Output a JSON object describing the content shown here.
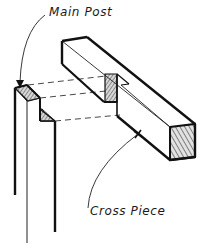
{
  "diagram": {
    "labels": {
      "main_post": "Main Post",
      "cross_piece": "Cross Piece"
    },
    "parts": [
      {
        "id": "main-post",
        "name": "Main Post",
        "description": "vertical post with notch cut at top"
      },
      {
        "id": "cross-piece",
        "name": "Cross Piece",
        "description": "horizontal beam with notch that fits over post"
      }
    ],
    "colors": {
      "ink": "#111111",
      "hatch": "#555555",
      "background": "#ffffff"
    }
  }
}
